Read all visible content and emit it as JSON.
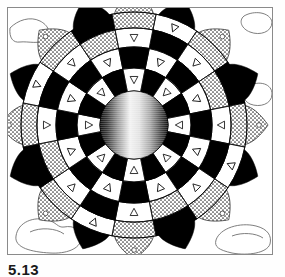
{
  "figure": {
    "caption": "5.13",
    "medium": "black and white line drawing with halftone screens",
    "frame": {
      "border_color": "#8a8a8a",
      "background_color": "#ffffff",
      "x": 7,
      "y": 7,
      "width": 266,
      "height": 248
    }
  },
  "chart_data": {
    "type": "pie",
    "subtitle": "",
    "xlabel": "",
    "ylabel": "",
    "legend_position": "none",
    "grid": false,
    "center": {
      "x": 133,
      "y": 124
    },
    "symmetry_order": 16,
    "sector_angle_degrees": 22.5,
    "rotation_offset_degrees": 11.25,
    "categories": [
      "petals",
      "outer-ring",
      "upper-mid-ring",
      "lower-mid-ring",
      "inner-ring",
      "core-sphere"
    ],
    "values": [
      16,
      16,
      16,
      16,
      16,
      1
    ],
    "rings": [
      {
        "name": "core-sphere",
        "index": 0,
        "inner_radius": 0,
        "outer_radius": 34,
        "segments": 1,
        "fill": "horizontal-gradient-sphere",
        "gradient_stops": [
          "#171717",
          "#f7f7f7",
          "#d9d9d9",
          "#2a2a2a"
        ],
        "markers": 0
      },
      {
        "name": "inner-ring",
        "index": 1,
        "inner_radius": 34,
        "outer_radius": 57,
        "segments": 16,
        "fill_cycle": [
          "#000000",
          "#ffffff"
        ],
        "markers": 8,
        "marker_shape": "triangle-outline"
      },
      {
        "name": "lower-mid-ring",
        "index": 2,
        "inner_radius": 57,
        "outer_radius": 78,
        "segments": 16,
        "fill_cycle": [
          "#ffffff",
          "#000000"
        ],
        "markers": 8,
        "marker_shape": "triangle-outline"
      },
      {
        "name": "upper-mid-ring",
        "index": 3,
        "inner_radius": 78,
        "outer_radius": 97,
        "segments": 16,
        "fill_cycle": [
          "#000000",
          "#ffffff",
          "stipple",
          "#ffffff"
        ],
        "markers": 8,
        "marker_shape": "triangle-outline"
      },
      {
        "name": "outer-ring",
        "index": 4,
        "inner_radius": 97,
        "outer_radius": 113,
        "segments": 16,
        "fill_cycle": [
          "#ffffff",
          "stipple",
          "#000000",
          "stipple"
        ],
        "markers": 8,
        "marker_shape": "triangle-outline"
      },
      {
        "name": "petals",
        "index": 5,
        "inner_radius": 108,
        "outer_radius": 134,
        "segments": 16,
        "fill_cycle": [
          "#000000",
          "stipple"
        ],
        "markers": 8,
        "marker_shape": "small-circle"
      }
    ],
    "colors": {
      "ink": "#000000",
      "paper": "#ffffff",
      "stipple": "#b9b9b9",
      "outline": "#3a3a3a",
      "frame": "#8a8a8a"
    },
    "annotations": [
      {
        "name": "background-blob-top-left",
        "shape": "cloud-outline",
        "x": 22,
        "y": 18
      },
      {
        "name": "background-blob-top-center",
        "shape": "cloud-outline",
        "x": 92,
        "y": 16
      },
      {
        "name": "background-blob-top-right",
        "shape": "cloud-outline",
        "x": 253,
        "y": 22
      },
      {
        "name": "background-blob-mid-right",
        "shape": "cloud-outline",
        "x": 258,
        "y": 92
      },
      {
        "name": "background-blob-bottom-left",
        "shape": "kidney-outline",
        "x": 36,
        "y": 232
      },
      {
        "name": "background-blob-bottom-right",
        "shape": "kidney-outline",
        "x": 246,
        "y": 236
      },
      {
        "name": "background-blob-mid-left",
        "shape": "cloud-outline",
        "x": 12,
        "y": 120
      }
    ]
  },
  "accessibility": {
    "alt_text": "A sixteen-fold symmetric rosette made of concentric checkered rings with small triangle markers, surrounded by sixteen pointed petals, with a shaded sphere at the center."
  }
}
